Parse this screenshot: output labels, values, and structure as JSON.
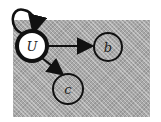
{
  "diagram": {
    "type": "directed-graph",
    "style": "hand-drawn",
    "nodes": [
      {
        "id": "U",
        "label": "U",
        "emphasized": true
      },
      {
        "id": "b",
        "label": "b",
        "emphasized": false
      },
      {
        "id": "c",
        "label": "c",
        "emphasized": false
      }
    ],
    "edges": [
      {
        "from": "U",
        "to": "U",
        "kind": "self-loop"
      },
      {
        "from": "U",
        "to": "b"
      },
      {
        "from": "U",
        "to": "c"
      }
    ],
    "colors": {
      "background": "#a8a8a8",
      "node_fill_emphasized": "#ffffff",
      "stroke": "#111111"
    }
  }
}
